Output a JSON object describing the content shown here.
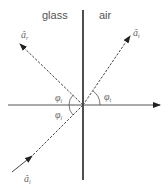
{
  "diagram": {
    "media": {
      "left": "glass",
      "right": "air"
    },
    "rays": {
      "reflected": {
        "label": "â",
        "subscript": "r"
      },
      "transmitted": {
        "label": "â",
        "subscript": "t"
      },
      "incident": {
        "label": "â",
        "subscript": "i"
      }
    },
    "angles": {
      "reflected_angle": {
        "label": "φ",
        "subscript": "i"
      },
      "incident_angle": {
        "label": "φ",
        "subscript": "i"
      },
      "transmitted_angle": {
        "label": "φ",
        "subscript": "t"
      }
    },
    "colors": {
      "interface_line": "#222222",
      "axis_line": "#555555",
      "ray": "#444444",
      "text": "#555555"
    }
  }
}
